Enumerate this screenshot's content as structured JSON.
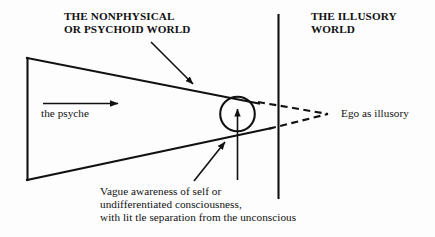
{
  "diagram": {
    "title_left": "THE NONPHYSICAL\nOR PSYCHOID WORLD",
    "title_right": "THE ILLUSORY\nWORLD",
    "label_psyche": "the psyche",
    "label_ego": "Ego as illusory",
    "caption_circle": "Vague awareness of self or\nundifferentiated consciousness,\nwith lit tle separation from the unconscious",
    "colors": {
      "ink": "#111111",
      "background": "#fdfdfd"
    },
    "shapes": {
      "psyche_wedge": "triangle-wedge",
      "divider": "vertical-divider-line",
      "self_circle": "circle",
      "arrow_psyche": "right-arrow",
      "arrow_to_top_edge": "diagonal-arrow-down-right",
      "arrow_to_bottom_edge": "diagonal-arrow-up-right",
      "arrow_to_circle": "up-arrow"
    }
  }
}
